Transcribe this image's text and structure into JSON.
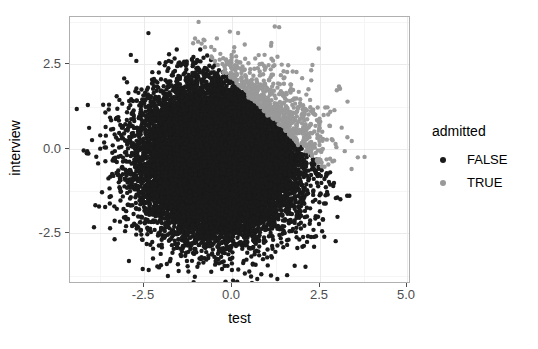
{
  "chart_data": {
    "type": "scatter",
    "title": "",
    "xlabel": "test",
    "ylabel": "interview",
    "xlim": [
      -4.6,
      5.1
    ],
    "ylim": [
      -4.0,
      3.9
    ],
    "xticks": [
      -2.5,
      0.0,
      2.5,
      5.0
    ],
    "xticklabels": [
      "-2.5",
      "0.0",
      "2.5",
      "5.0"
    ],
    "yticks": [
      2.5,
      0.0,
      -2.5
    ],
    "yticklabels": [
      "2.5",
      "0.0",
      "-2.5"
    ],
    "grid": true,
    "grid_minor": true,
    "legend_position": "right",
    "legend_title": "admitted",
    "point_size": 3.2,
    "n_points_total": 20000,
    "decision_boundary": {
      "description": "linear separation; points with test + interview above threshold are TRUE",
      "intercept": 2.05,
      "slope": -1.0
    },
    "series": [
      {
        "name": "FALSE",
        "color": "#1a1a1a",
        "n": 15200,
        "distribution": {
          "mean_x": -0.35,
          "mean_y": -0.35,
          "sd_x": 1.05,
          "sd_y": 1.05,
          "corr": 0.0
        },
        "side": "below"
      },
      {
        "name": "TRUE",
        "color": "#999999",
        "n": 4800,
        "distribution": {
          "mean_x": 0.0,
          "mean_y": 0.0,
          "sd_x": 1.05,
          "sd_y": 1.05,
          "corr": 0.0
        },
        "side": "above"
      }
    ]
  },
  "axes": {
    "x": {
      "title": "test",
      "ticks": [
        {
          "label": "-2.5",
          "value": -2.5
        },
        {
          "label": "0.0",
          "value": 0.0
        },
        {
          "label": "2.5",
          "value": 2.5
        },
        {
          "label": "5.0",
          "value": 5.0
        }
      ]
    },
    "y": {
      "title": "interview",
      "ticks": [
        {
          "label": "2.5",
          "value": 2.5
        },
        {
          "label": "0.0",
          "value": 0.0
        },
        {
          "label": "-2.5",
          "value": -2.5
        }
      ]
    }
  },
  "legend": {
    "title": "admitted",
    "items": [
      {
        "label": "FALSE",
        "color": "#1a1a1a"
      },
      {
        "label": "TRUE",
        "color": "#999999"
      }
    ]
  },
  "colors": {
    "panel_background": "#ffffff",
    "figure_background": "#ffffff",
    "grid_major": "#ebebeb",
    "grid_minor": "#f5f5f5",
    "panel_border": "#b0b0b0",
    "axis_text": "#4d4d4d",
    "title_text": "#000000"
  }
}
